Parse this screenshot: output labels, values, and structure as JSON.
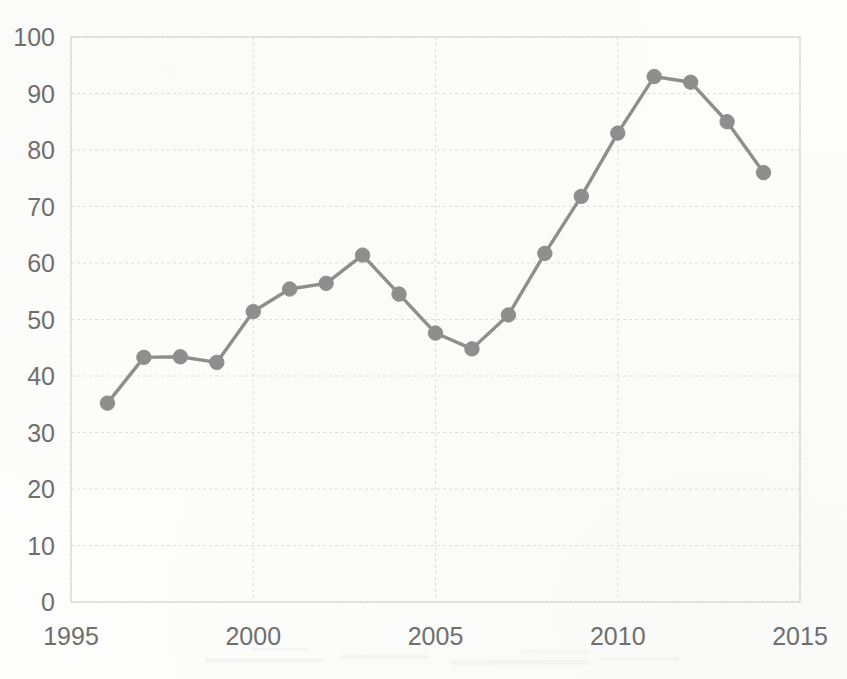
{
  "chart_data": {
    "type": "line",
    "title": "",
    "subtitle": "",
    "xlabel": "",
    "ylabel": "",
    "x": [
      1996,
      1997,
      1998,
      1999,
      2000,
      2001,
      2002,
      2003,
      2004,
      2005,
      2006,
      2007,
      2008,
      2009,
      2010,
      2011,
      2012,
      2013,
      2014
    ],
    "values": [
      35.2,
      43.3,
      43.4,
      42.4,
      51.4,
      55.4,
      56.4,
      61.4,
      54.5,
      47.6,
      44.8,
      50.8,
      61.7,
      71.8,
      83.0,
      93.0,
      92.0,
      85.0,
      76.0
    ],
    "series": [
      {
        "name": "series-1",
        "values": [
          35.2,
          43.3,
          43.4,
          42.4,
          51.4,
          55.4,
          56.4,
          61.4,
          54.5,
          47.6,
          44.8,
          50.8,
          61.7,
          71.8,
          83.0,
          93.0,
          92.0,
          85.0,
          76.0
        ]
      }
    ],
    "xlim": [
      1995,
      2015
    ],
    "ylim": [
      0,
      100
    ],
    "xticks": [
      1995,
      2000,
      2005,
      2010,
      2015
    ],
    "yticks": [
      0,
      10,
      20,
      30,
      40,
      50,
      60,
      70,
      80,
      90,
      100
    ],
    "xtick_labels": [
      "1995",
      "2000",
      "2005",
      "2010",
      "2015"
    ],
    "ytick_labels": [
      "0",
      "10",
      "20",
      "30",
      "40",
      "50",
      "60",
      "70",
      "80",
      "90",
      "100"
    ],
    "grid": true,
    "legend": null,
    "legend_position": "none",
    "marker": "circle",
    "line_color": "#8e8e8e",
    "marker_color": "#8e8e8e",
    "grid_color": "#d9d9d9",
    "text_color": "#6f6f6f",
    "background_color": "#fdfdfc"
  },
  "axes": {
    "y_ticks": [
      {
        "label": "100",
        "value": 100
      },
      {
        "label": "90",
        "value": 90
      },
      {
        "label": "80",
        "value": 80
      },
      {
        "label": "70",
        "value": 70
      },
      {
        "label": "60",
        "value": 60
      },
      {
        "label": "50",
        "value": 50
      },
      {
        "label": "40",
        "value": 40
      },
      {
        "label": "30",
        "value": 30
      },
      {
        "label": "20",
        "value": 20
      },
      {
        "label": "10",
        "value": 10
      },
      {
        "label": "0",
        "value": 0
      }
    ],
    "x_ticks": [
      {
        "label": "1995",
        "value": 1995
      },
      {
        "label": "2000",
        "value": 2000
      },
      {
        "label": "2005",
        "value": 2005
      },
      {
        "label": "2010",
        "value": 2010
      },
      {
        "label": "2015",
        "value": 2015
      }
    ]
  }
}
